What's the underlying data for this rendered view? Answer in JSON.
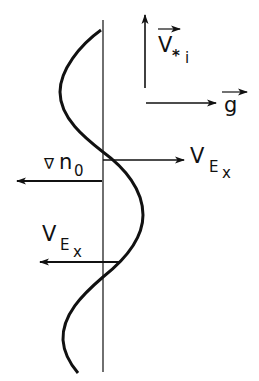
{
  "figure": {
    "width": 259,
    "height": 381,
    "background": "#ffffff",
    "ink_color": "#111111"
  },
  "labels": {
    "v_star_i": {
      "main": "V",
      "star": "*",
      "sub": "i",
      "vector": true
    },
    "g": {
      "main": "g",
      "vector": true
    },
    "grad_n0": {
      "nabla": "∇",
      "main": "n",
      "sub": "0"
    },
    "vex_upper": {
      "main": "V",
      "sub1": "E",
      "sub2": "x"
    },
    "vex_lower": {
      "main": "V",
      "sub1": "E",
      "sub2": "x"
    }
  },
  "elements": {
    "axis": {
      "x": 103,
      "y_top": 20,
      "y_bottom": 372
    },
    "wave_curve": "sinusoidal perturbation along vertical axis",
    "arrows": [
      {
        "name": "v-star-i-arrow",
        "direction": "up"
      },
      {
        "name": "g-arrow",
        "direction": "right"
      },
      {
        "name": "vex-upper-arrow",
        "direction": "right"
      },
      {
        "name": "grad-n0-arrow",
        "direction": "left"
      },
      {
        "name": "vex-lower-arrow",
        "direction": "left"
      }
    ]
  }
}
